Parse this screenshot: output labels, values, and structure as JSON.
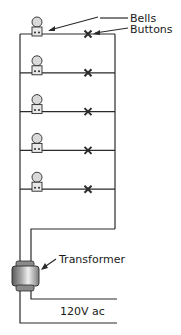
{
  "diagram": {
    "labels": {
      "bells": "Bells",
      "buttons": "Buttons",
      "transformer": "Transformer",
      "supply": "120V ac"
    },
    "rung_count": 5,
    "components": {
      "bell": "bell-icon",
      "button": "push-button-x",
      "transformer": "transformer-icon"
    },
    "colors": {
      "wire": "#2a2a2a",
      "bell_fill": "#d9d9d9",
      "transformer_core": "#a8a8a8",
      "transformer_highlight": "#f0f0f0"
    }
  }
}
